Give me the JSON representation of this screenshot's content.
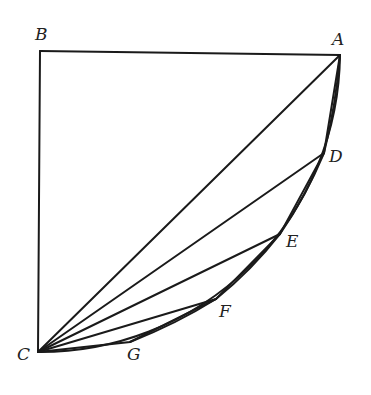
{
  "diagram": {
    "type": "geometric-figure",
    "points": {
      "A": {
        "label": "A",
        "x": 340,
        "y": 55
      },
      "B": {
        "label": "B",
        "x": 40,
        "y": 51
      },
      "C": {
        "label": "C",
        "x": 38,
        "y": 352
      },
      "D": {
        "label": "D",
        "x": 324,
        "y": 153
      },
      "E": {
        "label": "E",
        "x": 280,
        "y": 234
      },
      "F": {
        "label": "F",
        "x": 216,
        "y": 299
      },
      "G": {
        "label": "G",
        "x": 130,
        "y": 342
      }
    },
    "segments": [
      [
        "B",
        "A"
      ],
      [
        "B",
        "C"
      ],
      [
        "C",
        "A"
      ],
      [
        "C",
        "D"
      ],
      [
        "C",
        "E"
      ],
      [
        "C",
        "F"
      ],
      [
        "A",
        "D"
      ],
      [
        "D",
        "E"
      ],
      [
        "E",
        "F"
      ],
      [
        "F",
        "G"
      ],
      [
        "G",
        "C"
      ]
    ],
    "arc": {
      "from": "A",
      "to": "C",
      "through": [
        "D",
        "E",
        "F",
        "G"
      ]
    },
    "labels": [
      "A",
      "B",
      "C",
      "D",
      "E",
      "F",
      "G"
    ]
  }
}
